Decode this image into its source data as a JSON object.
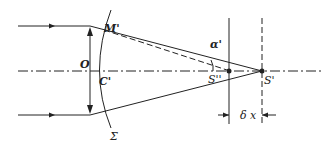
{
  "diagram": {
    "type": "optics ray diagram (focusing lens with wavefront and focal shift)",
    "labels": {
      "lens_center": "O",
      "wavefront_point": "M'",
      "wavefront_axis_point": "C'",
      "wavefront": "Σ",
      "angle": "α'",
      "paraxial_focus": "S''",
      "focus": "S'",
      "focal_shift": "δ x"
    },
    "colors": {
      "line": "#222222",
      "background": "#ffffff"
    }
  }
}
